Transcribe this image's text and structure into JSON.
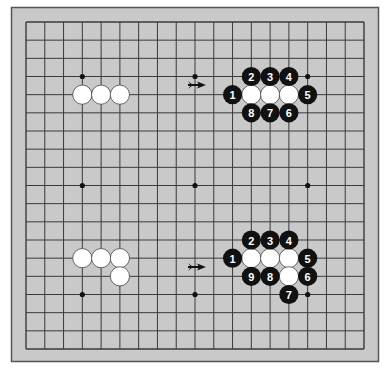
{
  "diagram": {
    "type": "go-board",
    "size": 19,
    "colors": {
      "page_background": "#ffffff",
      "board_fill": "#c9c9c9",
      "frame_stroke": "#555555",
      "grid_line": "#3a3a3a",
      "black_stone": "#111111",
      "white_stone": "#ffffff",
      "white_stone_outline": "#444444",
      "number_text": "#ffffff",
      "arrow": "#111111"
    },
    "star_points": [
      {
        "col": 4,
        "row": 4
      },
      {
        "col": 10,
        "row": 4
      },
      {
        "col": 16,
        "row": 4
      },
      {
        "col": 4,
        "row": 10
      },
      {
        "col": 10,
        "row": 10
      },
      {
        "col": 16,
        "row": 10
      },
      {
        "col": 4,
        "row": 16
      },
      {
        "col": 10,
        "row": 16
      },
      {
        "col": 16,
        "row": 16
      }
    ],
    "panels": [
      {
        "name": "top-before",
        "white_stones": [
          {
            "col": 4,
            "row": 5
          },
          {
            "col": 5,
            "row": 5
          },
          {
            "col": 6,
            "row": 5
          }
        ],
        "black_stones": []
      },
      {
        "name": "top-after",
        "white_stones": [
          {
            "col": 13,
            "row": 5
          },
          {
            "col": 14,
            "row": 5
          },
          {
            "col": 15,
            "row": 5
          }
        ],
        "black_stones": [
          {
            "col": 12,
            "row": 5,
            "label": "1"
          },
          {
            "col": 13,
            "row": 4,
            "label": "2"
          },
          {
            "col": 14,
            "row": 4,
            "label": "3"
          },
          {
            "col": 15,
            "row": 4,
            "label": "4"
          },
          {
            "col": 16,
            "row": 5,
            "label": "5"
          },
          {
            "col": 15,
            "row": 6,
            "label": "6"
          },
          {
            "col": 14,
            "row": 6,
            "label": "7"
          },
          {
            "col": 13,
            "row": 6,
            "label": "8"
          }
        ]
      },
      {
        "name": "bottom-before",
        "white_stones": [
          {
            "col": 4,
            "row": 14
          },
          {
            "col": 5,
            "row": 14
          },
          {
            "col": 6,
            "row": 14
          },
          {
            "col": 6,
            "row": 15
          }
        ],
        "black_stones": []
      },
      {
        "name": "bottom-after",
        "white_stones": [
          {
            "col": 13,
            "row": 14
          },
          {
            "col": 14,
            "row": 14
          },
          {
            "col": 15,
            "row": 14
          },
          {
            "col": 15,
            "row": 15
          }
        ],
        "black_stones": [
          {
            "col": 12,
            "row": 14,
            "label": "1"
          },
          {
            "col": 13,
            "row": 13,
            "label": "2"
          },
          {
            "col": 14,
            "row": 13,
            "label": "3"
          },
          {
            "col": 15,
            "row": 13,
            "label": "4"
          },
          {
            "col": 16,
            "row": 14,
            "label": "5"
          },
          {
            "col": 16,
            "row": 15,
            "label": "6"
          },
          {
            "col": 15,
            "row": 16,
            "label": "7"
          },
          {
            "col": 14,
            "row": 15,
            "label": "8"
          },
          {
            "col": 13,
            "row": 15,
            "label": "9"
          }
        ]
      }
    ],
    "arrows": [
      {
        "name": "top-arrow",
        "x1": 188,
        "x2": 206,
        "y": 85,
        "direction": "right"
      },
      {
        "name": "bottom-arrow",
        "x1": 188,
        "x2": 206,
        "y": 267,
        "direction": "right"
      }
    ]
  }
}
